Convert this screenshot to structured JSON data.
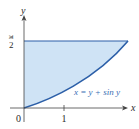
{
  "diagram": {
    "title": "",
    "axes": {
      "x_label": "x",
      "y_label": "y",
      "origin_label": "0",
      "x_ticks": [
        "1"
      ],
      "y_ticks": [
        "π/2"
      ]
    },
    "y_tick_numerator": "π",
    "y_tick_denominator": "2",
    "curve_label": "x = y + sin y",
    "region": {
      "description": "region bounded by y-axis, y = π/2, and x = y + sin y",
      "fill_color": "#cfe3f5",
      "boundary_color": "#2c5fa8"
    }
  }
}
